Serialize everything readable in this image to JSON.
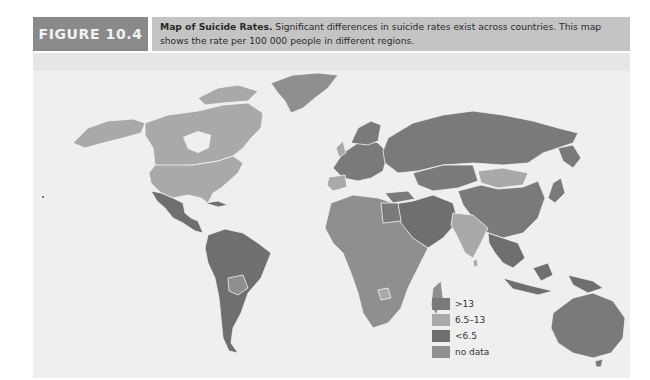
{
  "figure": {
    "label": "FIGURE 10.4",
    "caption_title": "Map of Suicide Rates.",
    "caption_text": " Significant differences in suicide rates exist across countries. This map shows the rate per 100 000 people in different regions."
  },
  "colors": {
    "header_label_bg": "#8a8a8a",
    "header_caption_bg": "#c4c4c4",
    "map_bg": "#efefef",
    "gt13": "#7a7a7a",
    "mid": "#a9a9a9",
    "lt6_5": "#6f6f6f",
    "no_data": "#8f8f8f",
    "border": "#f4f4f4"
  },
  "legend": {
    "items": [
      {
        "label": ">13",
        "color": "#7a7a7a"
      },
      {
        "label": "6.5–13",
        "color": "#a9a9a9"
      },
      {
        "label": "<6.5",
        "color": "#6f6f6f"
      },
      {
        "label": "no data",
        "color": "#8f8f8f"
      }
    ]
  },
  "regions": {
    "greenland": "no data",
    "north_america": "6.5–13",
    "mexico_central_america": "<6.5",
    "south_america": "<6.5",
    "russia": ">13",
    "europe": ">13",
    "china": ">13",
    "mongolia": "6.5–13",
    "india": "6.5–13",
    "africa": "no data",
    "middle_east": "<6.5",
    "southeast_asia": "<6.5",
    "australia": ">13",
    "new_zealand": ">13"
  }
}
